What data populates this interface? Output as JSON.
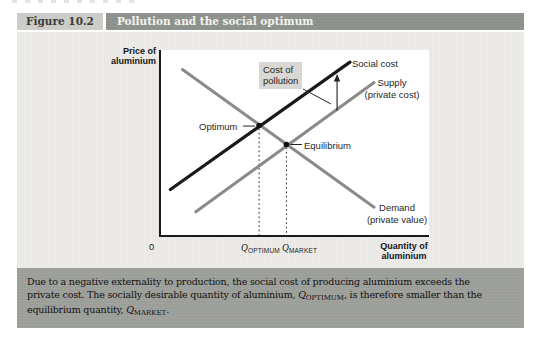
{
  "header": {
    "figure_label": "Figure 10.2",
    "title": "Pollution and the social optimum"
  },
  "chart": {
    "y_axis_label": "Price of\naluminium",
    "x_axis_label": "Quantity of\naluminium",
    "origin_label": "0",
    "labels": {
      "social_cost": "Social cost",
      "supply": "Supply\n(private cost)",
      "demand": "Demand\n(private value)",
      "cost_of_pollution": "Cost of\npollution",
      "optimum": "Optimum",
      "equilibrium": "Equilibrium"
    },
    "x_ticks": {
      "q_optimum": {
        "symbol": "Q",
        "sub": "OPTIMUM"
      },
      "q_market": {
        "symbol": "Q",
        "sub": "MARKET"
      }
    },
    "colors": {
      "social_cost_line": "#1a1a1a",
      "private_lines": "#8a8a8a",
      "annotation_ink": "#222222",
      "pollution_box_bg": "#d8d7d3",
      "figure_bg": "#ecebe8",
      "title_bar_bg": "#8c908b",
      "caption_bg": "#9c9e99"
    }
  },
  "caption": {
    "line1": "Due to a negative externality to production, the social cost of producing aluminium exceeds the",
    "line2_pre": "private cost. The socially desirable quantity of aluminium, ",
    "line2_q": {
      "symbol": "Q",
      "sub": "OPTIMUM"
    },
    "line2_post": ", is therefore smaller than the",
    "line3_pre": "equilibrium quantity, ",
    "line3_q": {
      "symbol": "Q",
      "sub": "MARKET"
    },
    "line3_post": "."
  },
  "chart_data": {
    "type": "line",
    "title": "Pollution and the social optimum",
    "xlabel": "Quantity of aluminium",
    "ylabel": "Price of aluminium",
    "axes_numeric": false,
    "units": "relative 0-100 coordinates within plot area (no numeric scale shown)",
    "x_axis_ticks": [
      "Q_OPTIMUM",
      "Q_MARKET"
    ],
    "legend_position": "labels-on-lines",
    "grid": false,
    "series": [
      {
        "name": "Social cost",
        "color": "#1a1a1a",
        "width": 3.2,
        "points": [
          [
            3.5,
            25
          ],
          [
            70.5,
            93.5
          ]
        ]
      },
      {
        "name": "Supply (private cost)",
        "color": "#8a8a8a",
        "width": 3,
        "points": [
          [
            13,
            13
          ],
          [
            79.5,
            82.5
          ]
        ]
      },
      {
        "name": "Demand (private value)",
        "color": "#8a8a8a",
        "width": 3,
        "points": [
          [
            8,
            89.5
          ],
          [
            79.5,
            15.5
          ]
        ]
      }
    ],
    "annotations": [
      {
        "name": "Optimum",
        "type": "point",
        "x": 36.6,
        "y": 59.4,
        "note": "Demand meets Social cost at quantity Q_OPTIMUM"
      },
      {
        "name": "Equilibrium",
        "type": "point",
        "x": 46.8,
        "y": 49.2,
        "note": "Demand meets Supply at quantity Q_MARKET"
      },
      {
        "name": "Cost of pollution",
        "type": "arrow",
        "x": 65.7,
        "y_from": 67.3,
        "y_to": 86.5,
        "note": "vertical gap between Supply and Social cost"
      }
    ],
    "drop_lines": [
      {
        "x": 36.6,
        "y": 59.4
      },
      {
        "x": 46.8,
        "y": 49.2
      }
    ],
    "leaders": [
      {
        "from": [
          30.6,
          59.1
        ],
        "to": [
          35.1,
          59.1
        ]
      },
      {
        "from": [
          48.2,
          49.2
        ],
        "to": [
          52.6,
          49.2
        ]
      },
      {
        "from": [
          53.0,
          79.0
        ],
        "to": [
          63.4,
          71.0
        ]
      }
    ]
  }
}
